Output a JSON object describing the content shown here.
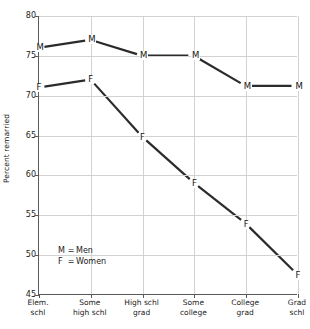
{
  "chart_data": {
    "type": "line",
    "title": "",
    "xlabel": "",
    "ylabel": "Percent remarried",
    "categories": [
      "Elem. schl",
      "Some high schl",
      "High schl grad",
      "Some college",
      "College grad",
      "Grad schl"
    ],
    "category_lines": [
      [
        "Elem.",
        "schl"
      ],
      [
        "Some",
        "high schl"
      ],
      [
        "High schl",
        "grad"
      ],
      [
        "Some",
        "college"
      ],
      [
        "College",
        "grad"
      ],
      [
        "Grad",
        "schl"
      ]
    ],
    "series": [
      {
        "name": "Men",
        "marker": "M",
        "values": [
          76.0,
          77.0,
          75.0,
          75.0,
          71.2,
          71.2
        ]
      },
      {
        "name": "Women",
        "marker": "F",
        "values": [
          71.0,
          72.0,
          64.8,
          59.0,
          53.9,
          47.5
        ]
      }
    ],
    "ylim": [
      45,
      80
    ],
    "yticks": [
      45,
      50,
      55,
      60,
      65,
      70,
      75,
      80
    ],
    "ytick_labels": [
      "45",
      "50",
      "55",
      "60",
      "65",
      "70",
      "75",
      "80"
    ],
    "grid": true,
    "legend_position": "inside-lower-left",
    "line_color": "#2b2b2b",
    "grid_color": "#d2d2d2",
    "axis_color": "#5a5a5a",
    "background_color": "#ffffff"
  },
  "legend": {
    "entries": [
      {
        "key": "M",
        "eq": "=",
        "label": "Men"
      },
      {
        "key": "F",
        "eq": "=",
        "label": "Women"
      }
    ]
  }
}
